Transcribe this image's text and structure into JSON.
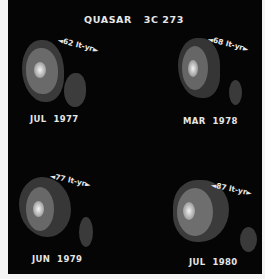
{
  "title": "QUASAR   3C 273",
  "panels": [
    {
      "date": "JUL  1977",
      "scale_value": "62",
      "scale_unit": "lt-yr"
    },
    {
      "date": "MAR  1978",
      "scale_value": "68",
      "scale_unit": "lt-yr"
    },
    {
      "date": "JUN  1979",
      "scale_value": "77",
      "scale_unit": "lt-yr"
    },
    {
      "date": "JUL  1980",
      "scale_value": "87",
      "scale_unit": "lt-yr"
    }
  ],
  "colors": {
    "background": "#050505",
    "border": "#f4f4f4",
    "text": "#e6e6e6"
  }
}
